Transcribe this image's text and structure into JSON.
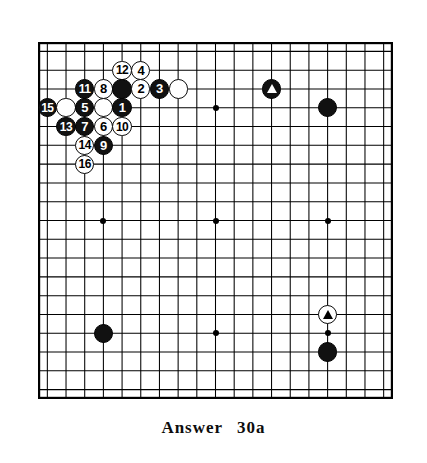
{
  "figure": {
    "kind": "go-board-diagram",
    "caption_label": "Answer",
    "caption_number": "30a"
  },
  "board": {
    "lines": 19,
    "visible_columns": 19,
    "visible_rows": 19,
    "line_color": "#000000",
    "background_color": "#ffffff",
    "border_color": "#000000",
    "star_points": [
      {
        "col": 3,
        "row": 3
      },
      {
        "col": 9,
        "row": 3
      },
      {
        "col": 15,
        "row": 3
      },
      {
        "col": 3,
        "row": 9
      },
      {
        "col": 9,
        "row": 9
      },
      {
        "col": 15,
        "row": 9
      },
      {
        "col": 3,
        "row": 15
      },
      {
        "col": 9,
        "row": 15
      },
      {
        "col": 15,
        "row": 15
      }
    ]
  },
  "colors": {
    "black_stone": "#111111",
    "white_stone": "#ffffff",
    "stone_outline": "#0a0a0a",
    "black_number_text": "#ffffff",
    "white_number_text": "#000000",
    "marker_on_black": "#ffffff",
    "marker_on_white": "#000000"
  },
  "stones": [
    {
      "name": "stone-move-12",
      "color": "white",
      "label": "12",
      "col": 4,
      "row": 1,
      "marker": ""
    },
    {
      "name": "stone-move-4",
      "color": "white",
      "label": "4",
      "col": 5,
      "row": 1,
      "marker": ""
    },
    {
      "name": "stone-move-11",
      "color": "black",
      "label": "11",
      "col": 2,
      "row": 2,
      "marker": ""
    },
    {
      "name": "stone-move-8",
      "color": "white",
      "label": "8",
      "col": 3,
      "row": 2,
      "marker": ""
    },
    {
      "name": "stone-black-plain-a",
      "color": "black",
      "label": "",
      "col": 4,
      "row": 2,
      "marker": ""
    },
    {
      "name": "stone-move-2",
      "color": "white",
      "label": "2",
      "col": 5,
      "row": 2,
      "marker": ""
    },
    {
      "name": "stone-move-3",
      "color": "black",
      "label": "3",
      "col": 6,
      "row": 2,
      "marker": ""
    },
    {
      "name": "stone-white-plain-a",
      "color": "white",
      "label": "",
      "col": 7,
      "row": 2,
      "marker": ""
    },
    {
      "name": "stone-black-triangle",
      "color": "black",
      "label": "",
      "col": 12,
      "row": 2,
      "marker": "triangle"
    },
    {
      "name": "stone-move-15",
      "color": "black",
      "label": "15",
      "col": 0,
      "row": 3,
      "marker": ""
    },
    {
      "name": "stone-white-plain-b",
      "color": "white",
      "label": "",
      "col": 1,
      "row": 3,
      "marker": ""
    },
    {
      "name": "stone-move-5",
      "color": "black",
      "label": "5",
      "col": 2,
      "row": 3,
      "marker": ""
    },
    {
      "name": "stone-white-plain-c",
      "color": "white",
      "label": "",
      "col": 3,
      "row": 3,
      "marker": ""
    },
    {
      "name": "stone-move-1",
      "color": "black",
      "label": "1",
      "col": 4,
      "row": 3,
      "marker": ""
    },
    {
      "name": "stone-black-corner-right",
      "color": "black",
      "label": "",
      "col": 15,
      "row": 3,
      "marker": ""
    },
    {
      "name": "stone-move-13",
      "color": "black",
      "label": "13",
      "col": 1,
      "row": 4,
      "marker": ""
    },
    {
      "name": "stone-move-7",
      "color": "black",
      "label": "7",
      "col": 2,
      "row": 4,
      "marker": ""
    },
    {
      "name": "stone-move-6",
      "color": "white",
      "label": "6",
      "col": 3,
      "row": 4,
      "marker": ""
    },
    {
      "name": "stone-move-10",
      "color": "white",
      "label": "10",
      "col": 4,
      "row": 4,
      "marker": ""
    },
    {
      "name": "stone-move-14",
      "color": "white",
      "label": "14",
      "col": 2,
      "row": 5,
      "marker": ""
    },
    {
      "name": "stone-move-9",
      "color": "black",
      "label": "9",
      "col": 3,
      "row": 5,
      "marker": ""
    },
    {
      "name": "stone-move-16",
      "color": "white",
      "label": "16",
      "col": 2,
      "row": 6,
      "marker": ""
    },
    {
      "name": "stone-white-triangle",
      "color": "white",
      "label": "",
      "col": 15,
      "row": 14,
      "marker": "triangle"
    },
    {
      "name": "stone-black-lower-left",
      "color": "black",
      "label": "",
      "col": 3,
      "row": 15,
      "marker": ""
    },
    {
      "name": "stone-black-lower-right",
      "color": "black",
      "label": "",
      "col": 15,
      "row": 16,
      "marker": ""
    }
  ]
}
